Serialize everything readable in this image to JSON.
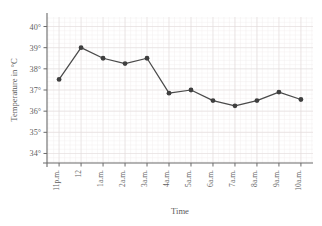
{
  "chart_data": {
    "type": "line",
    "title": "",
    "xlabel": "Time",
    "ylabel": "Temperature in °C",
    "categories": [
      "11p.m.",
      "12",
      "1a.m.",
      "2a.m.",
      "3a.m.",
      "4a.m.",
      "5a.m.",
      "6a.m.",
      "7a.m.",
      "8a.m.",
      "9a.m.",
      "10a.m."
    ],
    "values": [
      37.5,
      39.0,
      38.5,
      38.25,
      38.5,
      36.85,
      37.0,
      36.5,
      36.25,
      36.5,
      36.9,
      36.55
    ],
    "series": [
      {
        "name": "Temperature",
        "values": [
          37.5,
          39.0,
          38.5,
          38.25,
          38.5,
          36.85,
          37.0,
          36.5,
          36.25,
          36.5,
          36.9,
          36.55
        ]
      }
    ],
    "ytick_labels": [
      "34°",
      "35°",
      "36°",
      "37°",
      "38°",
      "39°",
      "40°"
    ],
    "ytick_values": [
      34,
      35,
      36,
      37,
      38,
      39,
      40
    ],
    "ylim": [
      33.55,
      40.45
    ],
    "xlim": [
      -0.55,
      11.55
    ],
    "grid": true,
    "grid_minor": true,
    "legend": false,
    "legend_position": "none",
    "marker": "circle",
    "line_color": "#4a4a4a",
    "marker_color": "#3f3f3f",
    "grid_color": "#e2dcdc",
    "axis_color": "#6b6b6b",
    "background": "#ffffff",
    "xtick_rotation": -90
  }
}
